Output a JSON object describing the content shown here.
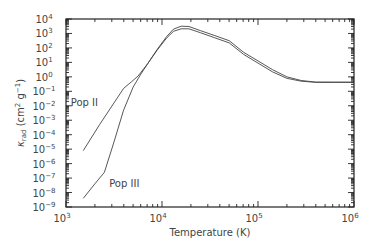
{
  "chart_data": {
    "type": "line",
    "title": "",
    "xlabel": "Temperature (K)",
    "ylabel": "κ_rad (cm² g⁻¹)",
    "ylabel_parts": {
      "symbol": "κ",
      "subscript": "rad",
      "units": "(cm",
      "units_exp": "2",
      "units_mid": " g",
      "units_exp2": "−1",
      "units_end": ")"
    },
    "xscale": "log",
    "yscale": "log",
    "xlim": [
      1000,
      1000000
    ],
    "ylim": [
      1e-09,
      10000
    ],
    "x_ticks": [
      {
        "base": "10",
        "exp": "3"
      },
      {
        "base": "10",
        "exp": "4"
      },
      {
        "base": "10",
        "exp": "5"
      },
      {
        "base": "10",
        "exp": "6"
      }
    ],
    "y_ticks": [
      {
        "base": "10",
        "exp": "4"
      },
      {
        "base": "10",
        "exp": "3"
      },
      {
        "base": "10",
        "exp": "2"
      },
      {
        "base": "10",
        "exp": "1"
      },
      {
        "base": "10",
        "exp": "0"
      },
      {
        "base": "10",
        "exp": "−1"
      },
      {
        "base": "10",
        "exp": "−2"
      },
      {
        "base": "10",
        "exp": "−3"
      },
      {
        "base": "10",
        "exp": "−4"
      },
      {
        "base": "10",
        "exp": "−5"
      },
      {
        "base": "10",
        "exp": "−6"
      },
      {
        "base": "10",
        "exp": "−7"
      },
      {
        "base": "10",
        "exp": "−8"
      },
      {
        "base": "10",
        "exp": "−9"
      }
    ],
    "grid": false,
    "legend": "none (inline annotations)",
    "annotations": [
      {
        "text": "Pop II",
        "log_x": 3.05,
        "log_y": -2.0
      },
      {
        "text": "Pop III",
        "log_x": 3.45,
        "log_y": -7.6
      }
    ],
    "series": [
      {
        "name": "Pop II",
        "log_points": [
          [
            3.18,
            -5.1
          ],
          [
            3.35,
            -3.3
          ],
          [
            3.5,
            -1.8
          ],
          [
            3.6,
            -0.8
          ],
          [
            3.68,
            -0.35
          ],
          [
            3.75,
            0.05
          ],
          [
            3.85,
            0.9
          ],
          [
            3.95,
            1.9
          ],
          [
            4.05,
            2.8
          ],
          [
            4.12,
            3.3
          ],
          [
            4.2,
            3.5
          ],
          [
            4.28,
            3.48
          ],
          [
            4.4,
            3.2
          ],
          [
            4.55,
            2.85
          ],
          [
            4.7,
            2.5
          ],
          [
            4.85,
            1.7
          ],
          [
            5.0,
            1.1
          ],
          [
            5.15,
            0.5
          ],
          [
            5.3,
            0.0
          ],
          [
            5.45,
            -0.25
          ],
          [
            5.6,
            -0.36
          ],
          [
            5.8,
            -0.37
          ],
          [
            6.0,
            -0.37
          ]
        ]
      },
      {
        "name": "Pop III",
        "log_points": [
          [
            3.18,
            -8.4
          ],
          [
            3.3,
            -7.4
          ],
          [
            3.4,
            -6.6
          ],
          [
            3.5,
            -4.5
          ],
          [
            3.6,
            -2.3
          ],
          [
            3.7,
            -0.7
          ],
          [
            3.78,
            0.2
          ],
          [
            3.85,
            0.9
          ],
          [
            3.95,
            1.85
          ],
          [
            4.05,
            2.7
          ],
          [
            4.12,
            3.15
          ],
          [
            4.2,
            3.32
          ],
          [
            4.28,
            3.32
          ],
          [
            4.4,
            3.05
          ],
          [
            4.55,
            2.7
          ],
          [
            4.7,
            2.35
          ],
          [
            4.85,
            1.55
          ],
          [
            5.0,
            0.95
          ],
          [
            5.15,
            0.35
          ],
          [
            5.3,
            -0.1
          ],
          [
            5.45,
            -0.3
          ],
          [
            5.6,
            -0.38
          ],
          [
            5.8,
            -0.38
          ],
          [
            6.0,
            -0.38
          ]
        ]
      }
    ]
  }
}
